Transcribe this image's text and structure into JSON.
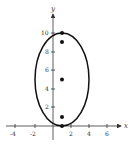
{
  "diagram": {
    "type": "ellipse-graph",
    "axes": {
      "x_label": "x",
      "y_label": "y",
      "x_ticks": [
        "-4",
        "-2",
        "2",
        "4",
        "6"
      ],
      "y_ticks": [
        "2",
        "4",
        "6",
        "8",
        "10"
      ]
    },
    "ellipse": {
      "center": [
        1,
        5
      ],
      "semi_axis_x": 3,
      "semi_axis_y": 5
    },
    "points": [
      {
        "x": 1,
        "y": 10,
        "role": "vertex"
      },
      {
        "x": 1,
        "y": 9,
        "role": "focus"
      },
      {
        "x": 1,
        "y": 5,
        "role": "center"
      },
      {
        "x": 1,
        "y": 1,
        "role": "focus"
      },
      {
        "x": 1,
        "y": 0,
        "role": "vertex"
      }
    ],
    "colors": {
      "stroke": "#111111",
      "axis": "#333333"
    }
  }
}
